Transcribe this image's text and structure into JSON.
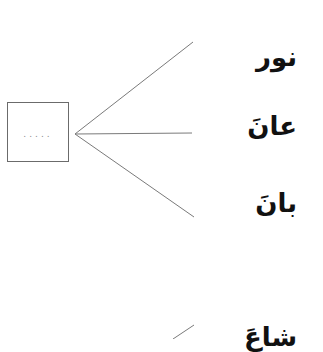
{
  "exercise": {
    "groups": [
      {
        "box": {
          "placeholder": "....."
        },
        "words": [
          {
            "text": "نور"
          },
          {
            "text": "عانَ"
          },
          {
            "text": "بانَ"
          }
        ]
      },
      {
        "box": {
          "placeholder": ""
        },
        "words": [
          {
            "text": "شاعَ"
          }
        ]
      }
    ]
  },
  "style": {
    "line_color": "#7a7a7a",
    "box_border_color": "#6b6b6b",
    "text_color": "#111111",
    "background": "#ffffff"
  }
}
